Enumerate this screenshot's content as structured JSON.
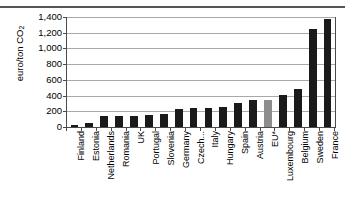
{
  "chart_data": {
    "type": "bar",
    "title": "",
    "subtitle": "",
    "xlabel": "",
    "ylabel": "euro/ton CO2",
    "ylabel_rich": {
      "main": "euro/ton CO",
      "sub": "2"
    },
    "ylim": [
      0,
      1400
    ],
    "yticks": [
      0,
      200,
      400,
      600,
      800,
      1000,
      1200,
      1400
    ],
    "ytick_labels": [
      "0",
      "200",
      "400",
      "600",
      "800",
      "1,000",
      "1,200",
      "1,400"
    ],
    "grid": true,
    "legend": "none",
    "categories": [
      "Finland",
      "Estonia",
      "Netherlands",
      "Romania",
      "UK",
      "Portugal",
      "Slovenia",
      "Germany",
      "Czech...",
      "Italy",
      "Hungary",
      "Spain",
      "Austria",
      "EU*",
      "Luxembourg",
      "Belgium",
      "Sweden",
      "France"
    ],
    "values": [
      20,
      55,
      135,
      135,
      145,
      150,
      172,
      225,
      237,
      247,
      258,
      305,
      345,
      342,
      405,
      478,
      1252,
      1370
    ],
    "bar_colors": [
      "#1a1a1a",
      "#1a1a1a",
      "#1a1a1a",
      "#1a1a1a",
      "#1a1a1a",
      "#1a1a1a",
      "#1a1a1a",
      "#1a1a1a",
      "#1a1a1a",
      "#1a1a1a",
      "#1a1a1a",
      "#1a1a1a",
      "#1a1a1a",
      "#8d8d8d",
      "#1a1a1a",
      "#1a1a1a",
      "#1a1a1a",
      "#1a1a1a"
    ],
    "highlight_category": "EU*",
    "highlight_color": "#8d8d8d",
    "bar_color": "#1a1a1a",
    "gridline_color": "#a9a9a9",
    "axis_color": "#4a4a4a"
  }
}
